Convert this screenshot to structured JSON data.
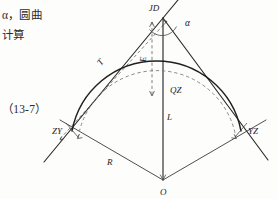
{
  "page": {
    "background_color": "#fdfdfc",
    "ink_color": "#1f1f1f"
  },
  "marginalia": {
    "line1": "α，圆曲",
    "line2": "计算",
    "equation_number": "（13-7）"
  },
  "figure": {
    "type": "circular-curve-survey-diagram",
    "labels": {
      "jd": "JD",
      "alpha": "α",
      "tangent": "T",
      "external": "E",
      "qz": "QZ",
      "zy": "ZY",
      "yz": "YZ",
      "length": "L",
      "radius": "R",
      "center": "O"
    },
    "points": {
      "jd": {
        "x": 163,
        "y": 18,
        "name": "intersection-point"
      },
      "zy": {
        "x": 72,
        "y": 131,
        "name": "curve-start-point"
      },
      "yz": {
        "x": 241,
        "y": 131,
        "name": "curve-end-point"
      },
      "qz": {
        "x": 163,
        "y": 96,
        "name": "curve-midpoint"
      },
      "o": {
        "x": 163,
        "y": 180,
        "name": "circle-center"
      }
    },
    "geometry": {
      "radius_px": 86,
      "arc_sweep_deg": 88,
      "apex_angle_alpha_deg": 88,
      "offset_dashed_radius_px": 77
    }
  }
}
